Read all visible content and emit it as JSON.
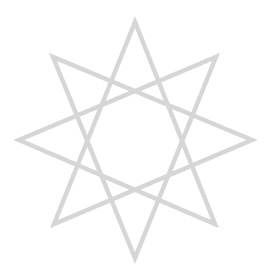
{
  "figure": {
    "shape": "octagram",
    "stroke_color": "#d6d6d6",
    "stroke_width": 4.5,
    "background": "#ffffff",
    "vertices": [
      [
        135,
        22
      ],
      [
        216,
        57
      ],
      [
        252,
        140
      ],
      [
        215,
        224
      ],
      [
        135,
        258
      ],
      [
        54,
        224
      ],
      [
        19,
        140
      ],
      [
        53,
        57
      ]
    ],
    "step": 3
  }
}
